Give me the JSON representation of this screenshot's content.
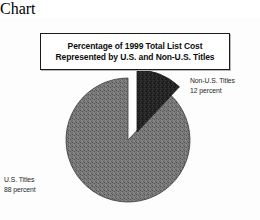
{
  "chart_data": {
    "type": "pie",
    "title": "Percentage of 1999 Total List Cost Represented by U.S. and Non-U.S. Titles",
    "title_lines": [
      "Percentage of 1999 Total List Cost",
      "Represented by U.S. and Non-U.S. Titles"
    ],
    "categories": [
      "U.S. Titles",
      "Non-U.S. Titles"
    ],
    "values": [
      88,
      12
    ],
    "unit": "percent",
    "labels": [
      {
        "name": "U.S. Titles",
        "value": "88 percent",
        "percent": 88,
        "color": "#6e6e6e",
        "exploded": false
      },
      {
        "name": "Non-U.S. Titles",
        "value": "12 percent",
        "percent": 12,
        "color": "#2a2a2a",
        "exploded": true
      }
    ],
    "legend": "none",
    "grid": false,
    "start_angle_deg": 0,
    "direction": "clockwise",
    "xlabel": "",
    "ylabel": ""
  },
  "title": {
    "line1": "Percentage of 1999 Total List Cost",
    "line2": "Represented by U.S. and Non-U.S. Titles"
  },
  "labels": {
    "non_us": {
      "name": "Non-U.S. Titles",
      "value": "12 percent"
    },
    "us": {
      "name": "U.S. Titles",
      "value": "88 percent"
    }
  },
  "colors": {
    "us_slice": "#6e6e6e",
    "non_us_slice": "#2a2a2a",
    "outline": "#1a1a1a",
    "background": "#fdfdfd",
    "text": "#1f1f1f"
  }
}
